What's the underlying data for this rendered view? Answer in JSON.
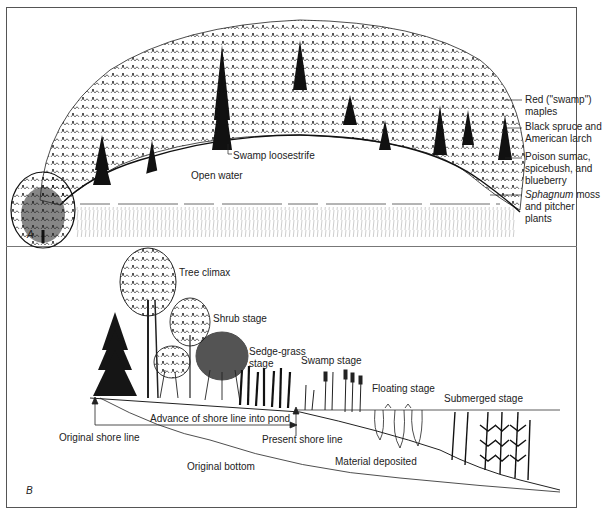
{
  "figure": {
    "panels": [
      {
        "id": "A",
        "letter": "A",
        "labels": {
          "open_water": "Open water",
          "swamp_loosestrife": "Swamp loosestrife",
          "red_maples_1": "Red (\"swamp\")",
          "red_maples_2": "maples",
          "black_spruce_1": "Black spruce and",
          "black_spruce_2": "American larch",
          "poison_sumac_1": "Poison sumac,",
          "poison_sumac_2": "spicebush, and",
          "poison_sumac_3": "blueberry",
          "sphagnum_italic": "Sphagnum",
          "sphagnum_1_rest": " moss",
          "sphagnum_2": "and pitcher",
          "sphagnum_3": "plants"
        }
      },
      {
        "id": "B",
        "letter": "B",
        "labels": {
          "tree_climax": "Tree climax",
          "shrub_stage": "Shrub stage",
          "sedge_grass_1": "Sedge-grass",
          "sedge_grass_2": "stage",
          "swamp_stage": "Swamp stage",
          "floating_stage": "Floating stage",
          "submerged_stage": "Submerged stage",
          "advance": "Advance of shore line into pond",
          "original_shore": "Original shore line",
          "present_shore": "Present shore line",
          "original_bottom": "Original bottom",
          "material_deposited": "Material deposited"
        }
      }
    ]
  }
}
